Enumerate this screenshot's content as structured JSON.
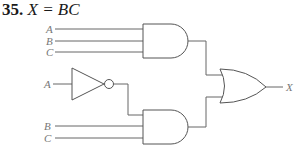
{
  "problem": {
    "number": "35.",
    "expression": "X = BC"
  },
  "circuit": {
    "inputs_gate1": [
      "A",
      "B",
      "C"
    ],
    "input_inverter": "A",
    "inputs_gate2": [
      "B",
      "C"
    ],
    "output": "X",
    "gates": [
      {
        "type": "AND",
        "inputs": [
          "A",
          "B",
          "C"
        ]
      },
      {
        "type": "NOT",
        "inputs": [
          "A"
        ]
      },
      {
        "type": "AND",
        "inputs": [
          "A'",
          "B",
          "C"
        ]
      },
      {
        "type": "OR",
        "inputs": [
          "AND1",
          "AND2"
        ],
        "output": "X"
      }
    ],
    "line_color": "#666666",
    "label_color": "#777777"
  }
}
